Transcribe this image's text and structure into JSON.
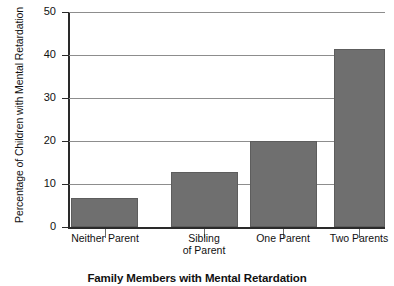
{
  "chart_data": {
    "type": "bar",
    "title": "Family Members with Mental Retardation",
    "xlabel": "Family Members with Mental Retardation",
    "ylabel": "Percentage of Children with Mental Retardation",
    "categories": [
      "Neither Parent",
      "Sibling\nof Parent",
      "One Parent",
      "Two Parents"
    ],
    "values": [
      6.7,
      12.8,
      20.0,
      41.5
    ],
    "ylim": [
      0,
      50
    ],
    "yticks": [
      0,
      10,
      20,
      30,
      40,
      50
    ],
    "ytick_labels": [
      "0",
      "10",
      "20",
      "30",
      "40",
      "50"
    ],
    "grid": true,
    "legend": "none",
    "bar_color": "#6f6f6f",
    "axis_color": "#2a2a2a",
    "grid_color": "#8d8d8d",
    "background": "#ffffff"
  }
}
